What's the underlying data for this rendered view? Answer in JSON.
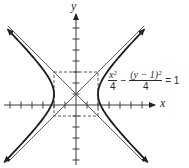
{
  "chart_data": {
    "type": "line",
    "title": "",
    "xlabel": "x",
    "ylabel": "y",
    "equation": {
      "term1_num": "x²",
      "term1_den": "4",
      "operator": "−",
      "term2_num": "(y − 1)²",
      "term2_den": "4",
      "rhs": "= 1"
    },
    "curve": "hyperbola",
    "center": [
      0,
      1
    ],
    "a": 2,
    "b": 2,
    "vertices": [
      [
        -2,
        1
      ],
      [
        2,
        1
      ]
    ],
    "asymptotes": [
      "y - 1 = x",
      "y - 1 = -x"
    ],
    "reference_rectangle": {
      "x": [
        -2,
        2
      ],
      "y": [
        -1,
        3
      ],
      "style": "dashed"
    },
    "xlim": [
      -6.5,
      7
    ],
    "ylim": [
      -5,
      8
    ],
    "x_ticks": [
      -6,
      -5,
      -4,
      -3,
      -2,
      -1,
      1,
      2,
      3,
      4,
      5,
      6
    ],
    "y_ticks": [
      -5,
      -4,
      -3,
      -2,
      -1,
      1,
      2,
      3,
      4,
      5,
      6,
      7
    ],
    "grid": false,
    "tick_labels_shown": false
  },
  "axes": {
    "x_label": "x",
    "y_label": "y"
  },
  "colors": {
    "curve": "#1a1a1a",
    "axis": "#3a3a3a",
    "asymptote": "#4a4a4a",
    "rect": "#4a4a4a"
  }
}
